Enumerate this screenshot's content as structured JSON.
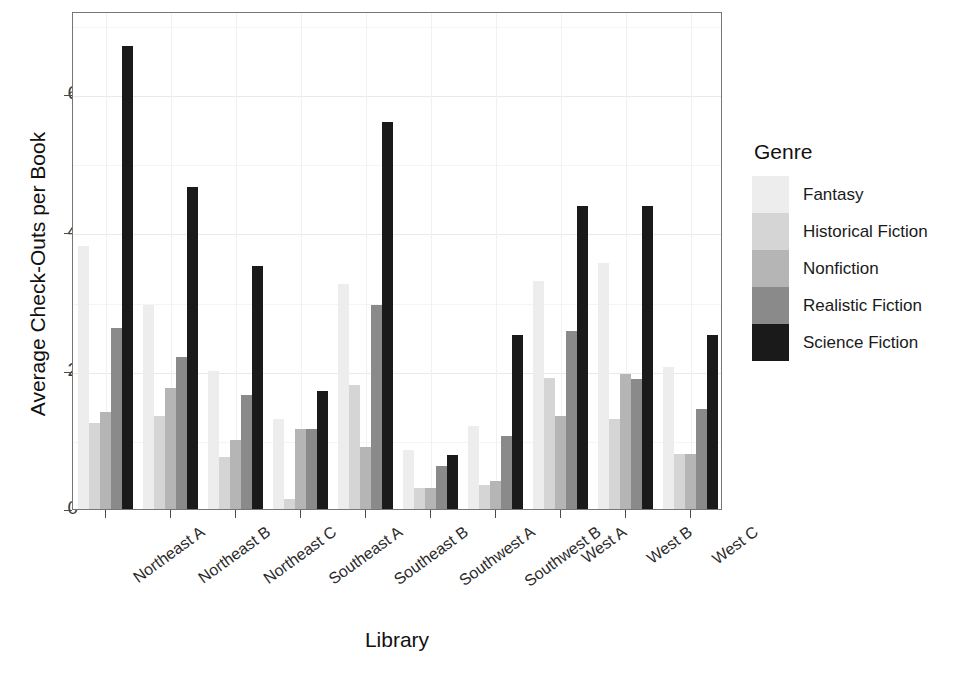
{
  "chart_data": {
    "type": "bar",
    "title": "",
    "xlabel": "Library",
    "ylabel": "Average Check-Outs per Book",
    "categories": [
      "Northeast A",
      "Northeast B",
      "Northeast C",
      "Southeast A",
      "Southeast B",
      "Southwest A",
      "Southwest B",
      "West A",
      "West B",
      "West C"
    ],
    "ylim": [
      0,
      7.2
    ],
    "yticks": [
      0,
      2,
      4,
      6
    ],
    "ytick_labels": [
      "0",
      "2",
      "4",
      "6"
    ],
    "grid": true,
    "legend_title": "Genre",
    "legend_position": "right",
    "series": [
      {
        "name": "Fantasy",
        "color": "#ededed",
        "values": [
          3.8,
          2.95,
          2.0,
          1.3,
          3.25,
          0.85,
          1.2,
          3.3,
          3.55,
          2.05
        ]
      },
      {
        "name": "Historical Fiction",
        "color": "#d5d5d5",
        "values": [
          1.25,
          1.35,
          0.75,
          0.15,
          1.8,
          0.3,
          0.35,
          1.9,
          1.3,
          0.8
        ]
      },
      {
        "name": "Nonfiction",
        "color": "#b5b5b5",
        "values": [
          1.4,
          1.75,
          1.0,
          1.15,
          0.9,
          0.3,
          0.4,
          1.35,
          1.95,
          0.8
        ]
      },
      {
        "name": "Realistic Fiction",
        "color": "#8a8a8a",
        "values": [
          2.62,
          2.2,
          1.65,
          1.15,
          2.95,
          0.62,
          1.05,
          2.58,
          1.88,
          1.45
        ]
      },
      {
        "name": "Science Fiction",
        "color": "#1a1a1a",
        "values": [
          6.7,
          4.65,
          3.52,
          1.7,
          5.6,
          0.78,
          2.52,
          4.38,
          4.38,
          2.52
        ]
      }
    ]
  }
}
